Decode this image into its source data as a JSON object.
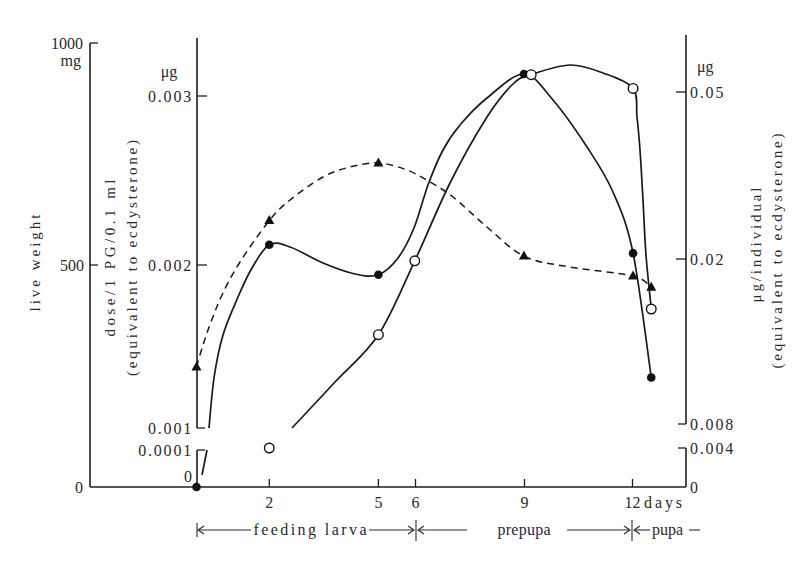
{
  "axes": {
    "live_weight": {
      "title": "live weight",
      "unit": "mg",
      "ticks": [
        "1000",
        "500",
        "0"
      ]
    },
    "dose": {
      "unit": "μg",
      "title": "dose/1 PG/0.1 ml",
      "subtitle": "(equivalent to ecdysterone)",
      "ticks": [
        "0.003",
        "0.002",
        "0.001",
        "0.0001",
        "0"
      ]
    },
    "titer": {
      "unit": "μg",
      "title": "μg/individual",
      "subtitle": "(equivalent to ecdysterone)",
      "ticks": [
        "0.05",
        "0.02",
        "0.008",
        "0.004",
        "0"
      ]
    },
    "days": {
      "ticks": [
        "2",
        "5",
        "6",
        "9",
        "12"
      ],
      "unit": "days"
    }
  },
  "phases": [
    {
      "label": "feeding larva"
    },
    {
      "label": "prepupa"
    },
    {
      "label": "pupa"
    }
  ],
  "chart_data": {
    "type": "line",
    "title": "",
    "xlabel": "days",
    "x_ticks": [
      2,
      5,
      6,
      9,
      12
    ],
    "xlim": [
      0,
      12.5
    ],
    "grid": false,
    "legend": null,
    "phases": [
      {
        "label": "feeding larva",
        "from_day": 0,
        "to_day": 6
      },
      {
        "label": "prepupa",
        "from_day": 6,
        "to_day": 12
      },
      {
        "label": "pupa",
        "from_day": 12
      }
    ],
    "y_axes": {
      "left_outer": {
        "label": "live weight",
        "unit": "mg",
        "scale": "linear",
        "ticks": [
          0,
          500,
          1000
        ],
        "ylim": [
          0,
          1000
        ]
      },
      "left_inner": {
        "label": "dose/1 PG/0.1 ml (equivalent to ecdysterone)",
        "unit": "μg",
        "scale": "linear, broken between 0.0001 and 0.001",
        "ticks": [
          0,
          0.0001,
          0.001,
          0.002,
          0.003
        ]
      },
      "right": {
        "label": "μg/individual (equivalent to ecdysterone)",
        "unit": "μg",
        "scale": "log, broken between 0.004 and 0.008",
        "ticks": [
          0,
          0.004,
          0.008,
          0.02,
          0.05
        ]
      }
    },
    "series": [
      {
        "name": "live weight",
        "marker": "filled-triangle",
        "line": "dashed",
        "axis": "left_outer",
        "x": [
          0,
          2,
          5,
          9,
          12,
          12.5
        ],
        "values": [
          270,
          600,
          730,
          520,
          475,
          450
        ]
      },
      {
        "name": "dose/1 PG/0.1 ml",
        "marker": "filled-circle",
        "line": "solid",
        "axis": "left_inner",
        "x": [
          0,
          2,
          5,
          9,
          12,
          12.5
        ],
        "values": [
          0,
          0.00212,
          0.00194,
          0.00313,
          0.00207,
          0.00131
        ]
      },
      {
        "name": "μg/individual",
        "marker": "open-circle",
        "line": "solid",
        "axis": "right",
        "x": [
          2,
          5,
          6,
          9.2,
          12,
          12.5
        ],
        "values": [
          0.004,
          0.0132,
          0.0198,
          0.055,
          0.051,
          0.0152
        ]
      }
    ]
  }
}
